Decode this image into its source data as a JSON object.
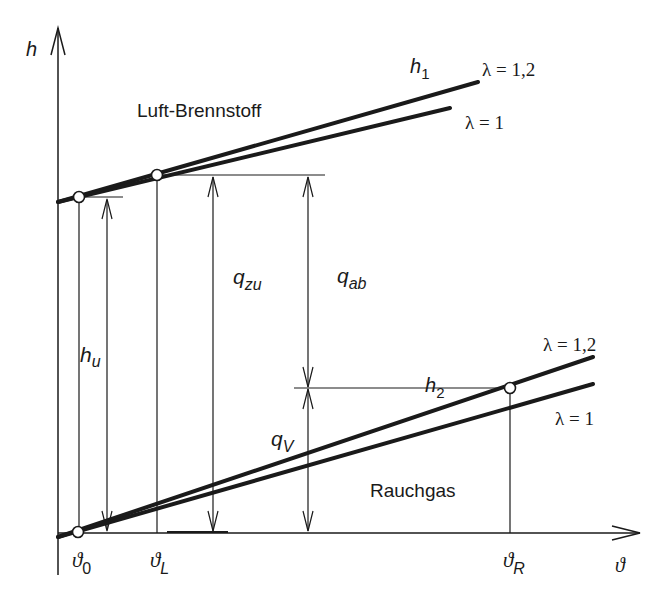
{
  "axes": {
    "y_label": "h",
    "x_label": "ϑ"
  },
  "regions": {
    "upper": "Luft-Brennstoff",
    "lower": "Rauchgas"
  },
  "curves": {
    "upper_name": "h",
    "upper_sub": "1",
    "upper_lambda_high": "λ = 1,2",
    "upper_lambda_low": "λ = 1",
    "lower_lambda_high": "λ = 1,2",
    "lower_lambda_low": "λ = 1",
    "lower_name": "h",
    "lower_sub": "2"
  },
  "dimensions": {
    "hu": {
      "main": "h",
      "sub": "u"
    },
    "qzu": {
      "main": "q",
      "sub": "zu"
    },
    "qab": {
      "main": "q",
      "sub": "ab"
    },
    "qv": {
      "main": "q",
      "sub": "V"
    }
  },
  "x_ticks": {
    "t0": {
      "main": "ϑ",
      "sub": "0"
    },
    "tL": {
      "main": "ϑ",
      "sub": "L"
    },
    "tR": {
      "main": "ϑ",
      "sub": "R"
    }
  },
  "colors": {
    "ink": "#1a1a1a",
    "background": "#ffffff"
  }
}
